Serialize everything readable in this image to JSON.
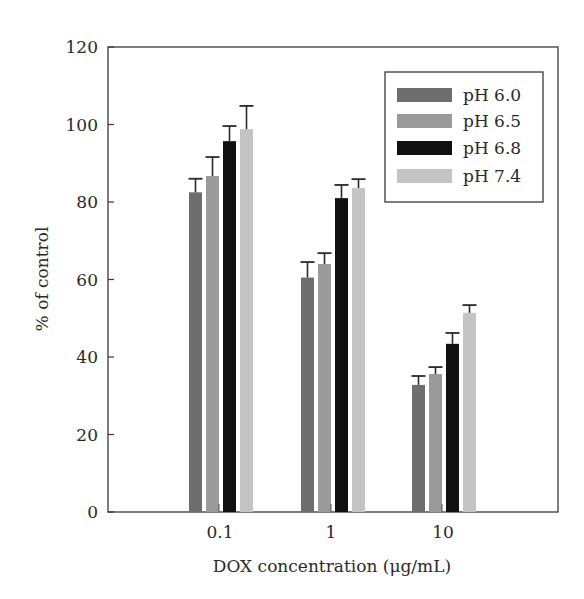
{
  "chart_data": {
    "type": "bar",
    "title": "",
    "xlabel": "DOX concentration (μg/mL)",
    "ylabel": "% of control",
    "ylim": [
      0,
      120
    ],
    "yticks": [
      0,
      20,
      40,
      60,
      80,
      100,
      120
    ],
    "categories": [
      "0.1",
      "1",
      "10"
    ],
    "grid": false,
    "legend_position": "upper right (inside)",
    "series": [
      {
        "name": "pH 6.0",
        "color": "#6e6e6e",
        "values": [
          82.5,
          60.5,
          32.8
        ],
        "errors": [
          3.5,
          4.0,
          2.3
        ]
      },
      {
        "name": "pH 6.5",
        "color": "#9a9a9a",
        "values": [
          86.7,
          64.0,
          35.6
        ],
        "errors": [
          4.9,
          2.8,
          1.8
        ]
      },
      {
        "name": "pH 6.8",
        "color": "#111111",
        "values": [
          95.7,
          81.0,
          43.4
        ],
        "errors": [
          3.9,
          3.4,
          2.8
        ]
      },
      {
        "name": "pH 7.4",
        "color": "#c4c4c4",
        "values": [
          98.8,
          83.6,
          51.4
        ],
        "errors": [
          6.0,
          2.3,
          2.0
        ]
      }
    ]
  }
}
